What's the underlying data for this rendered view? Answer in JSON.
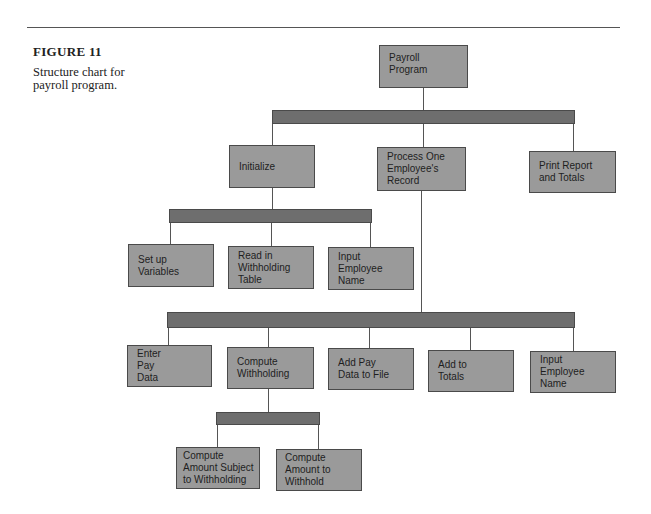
{
  "figure": {
    "label": "FIGURE 11",
    "caption": "Structure chart for payroll program."
  },
  "colors": {
    "box_fill": "#9a9a9a",
    "bar_fill": "#6e6e6e",
    "border": "#4a4a4a"
  },
  "chart": {
    "root": "Payroll\nProgram",
    "level1": [
      "Initialize",
      "Process One\nEmployee's\nRecord",
      "Print Report\nand Totals"
    ],
    "initialize_children": [
      "Set up\nVariables",
      "Read in\nWithholding\nTable",
      "Input\nEmployee\nName"
    ],
    "process_children": [
      "Enter\nPay\nData",
      "Compute\nWithholding",
      "Add Pay\nData to File",
      "Add to\nTotals",
      "Input\nEmployee\nName"
    ],
    "withholding_children": [
      "Compute\nAmount Subject\nto Withholding",
      "Compute\nAmount to\nWithhold"
    ]
  }
}
